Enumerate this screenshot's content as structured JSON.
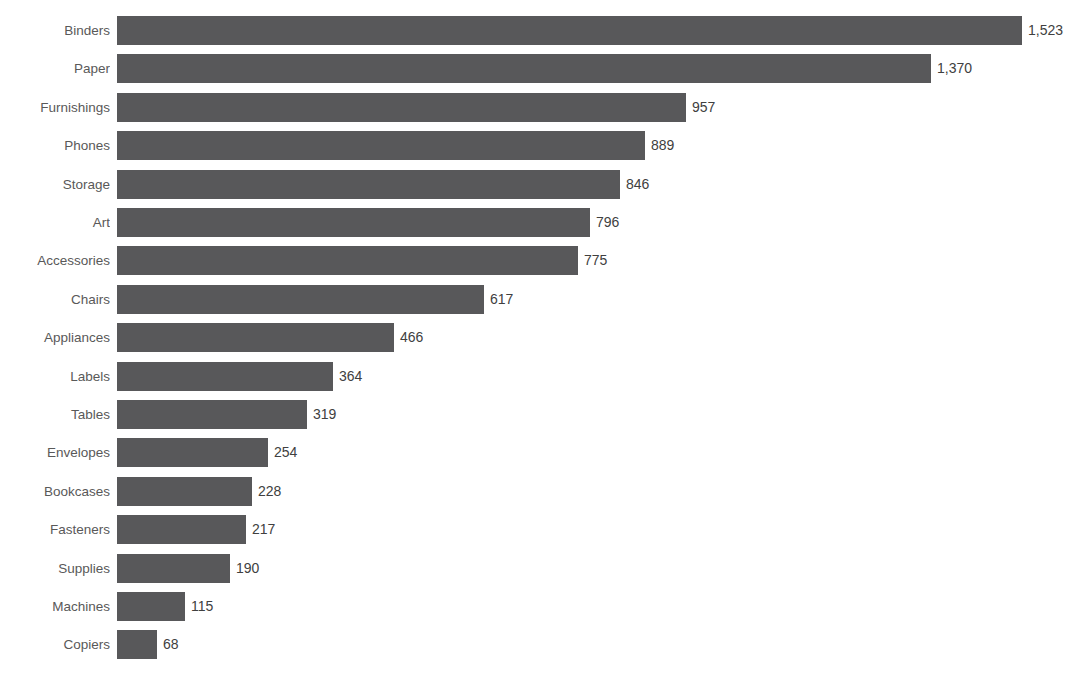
{
  "chart_data": {
    "type": "bar",
    "orientation": "horizontal",
    "title": "",
    "subtitle": "",
    "xlabel": "",
    "ylabel": "",
    "grid": false,
    "legend": false,
    "legend_position": "none",
    "axis_visible": false,
    "xlim": [
      0,
      1523
    ],
    "sorted": "descending",
    "bar_color": "#58585A",
    "label_color": "#595959",
    "value_color": "#404040",
    "background": "#FFFFFF",
    "categories": [
      "Binders",
      "Paper",
      "Furnishings",
      "Phones",
      "Storage",
      "Art",
      "Accessories",
      "Chairs",
      "Appliances",
      "Labels",
      "Tables",
      "Envelopes",
      "Bookcases",
      "Fasteners",
      "Supplies",
      "Machines",
      "Copiers"
    ],
    "values": [
      1523,
      1370,
      957,
      889,
      846,
      796,
      775,
      617,
      466,
      364,
      319,
      254,
      228,
      217,
      190,
      115,
      68
    ],
    "value_labels": [
      "1,523",
      "1,370",
      "957",
      "889",
      "846",
      "796",
      "775",
      "617",
      "466",
      "364",
      "319",
      "254",
      "228",
      "217",
      "190",
      "115",
      "68"
    ],
    "bars": [
      {
        "category": "Binders",
        "value": 1523,
        "label": "1,523"
      },
      {
        "category": "Paper",
        "value": 1370,
        "label": "1,370"
      },
      {
        "category": "Furnishings",
        "value": 957,
        "label": "957"
      },
      {
        "category": "Phones",
        "value": 889,
        "label": "889"
      },
      {
        "category": "Storage",
        "value": 846,
        "label": "846"
      },
      {
        "category": "Art",
        "value": 796,
        "label": "796"
      },
      {
        "category": "Accessories",
        "value": 775,
        "label": "775"
      },
      {
        "category": "Chairs",
        "value": 617,
        "label": "617"
      },
      {
        "category": "Appliances",
        "value": 466,
        "label": "466"
      },
      {
        "category": "Labels",
        "value": 364,
        "label": "364"
      },
      {
        "category": "Tables",
        "value": 319,
        "label": "319"
      },
      {
        "category": "Envelopes",
        "value": 254,
        "label": "254"
      },
      {
        "category": "Bookcases",
        "value": 228,
        "label": "228"
      },
      {
        "category": "Fasteners",
        "value": 217,
        "label": "217"
      },
      {
        "category": "Supplies",
        "value": 190,
        "label": "190"
      },
      {
        "category": "Machines",
        "value": 115,
        "label": "115"
      },
      {
        "category": "Copiers",
        "value": 68,
        "label": "68"
      }
    ]
  }
}
